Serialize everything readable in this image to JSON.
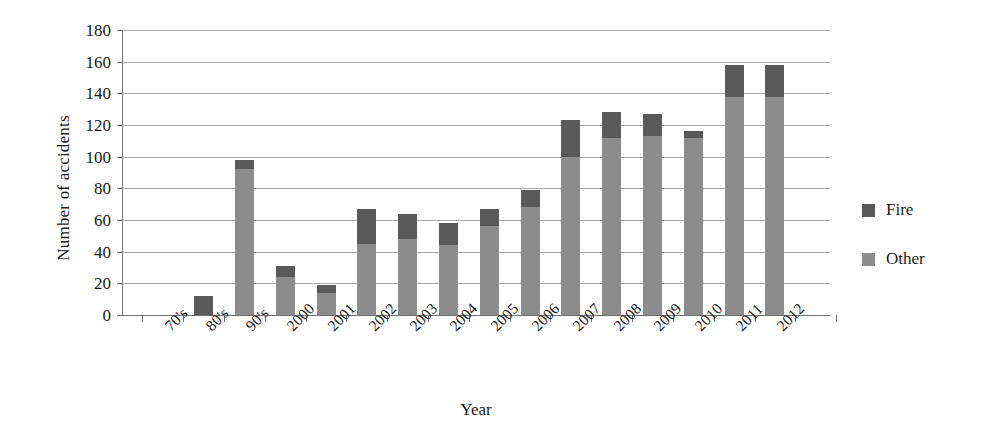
{
  "chart_data": {
    "type": "bar",
    "subtype": "stacked-bar",
    "title": "",
    "xlabel": "Year",
    "ylabel": "Number of accidents",
    "ylim": [
      0,
      180
    ],
    "ytick_step": 20,
    "yticks": [
      180,
      160,
      140,
      120,
      100,
      80,
      60,
      40,
      20,
      0
    ],
    "grid": true,
    "grid_axis": "y",
    "legend_position": "right",
    "categories": [
      "70's",
      "80's",
      "90's",
      "2000",
      "2001",
      "2002",
      "2003",
      "2004",
      "2005",
      "2006",
      "2007",
      "2008",
      "2009",
      "2010",
      "2011",
      "2012"
    ],
    "series": [
      {
        "name": "Other",
        "color": "#8c8c8c",
        "values": [
          0,
          0,
          92,
          24,
          14,
          45,
          48,
          44,
          56,
          68,
          100,
          112,
          113,
          112,
          138,
          138
        ]
      },
      {
        "name": "Fire",
        "color": "#595959",
        "values": [
          0,
          12,
          6,
          7,
          5,
          22,
          16,
          14,
          11,
          11,
          23,
          16,
          14,
          4,
          20,
          20
        ]
      }
    ],
    "totals": [
      0,
      12,
      98,
      31,
      19,
      67,
      64,
      58,
      67,
      79,
      123,
      128,
      127,
      116,
      158,
      158
    ]
  },
  "legend": {
    "items": [
      {
        "label": "Fire",
        "color": "#595959"
      },
      {
        "label": "Other",
        "color": "#8c8c8c"
      }
    ]
  }
}
